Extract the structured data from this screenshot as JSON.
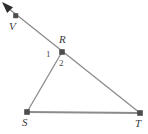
{
  "figure": {
    "type": "geometry-diagram",
    "background_color": "#ffffff",
    "line_color": "#8c8c8c",
    "marker_color": "#4d4d4d",
    "label_color": "#3a3a3a",
    "width": 148,
    "height": 134,
    "points": [
      {
        "id": "arrowtip",
        "label": "",
        "x": 2.5,
        "y": 2.5,
        "marker": false
      },
      {
        "id": "V",
        "label": "V",
        "x": 16,
        "y": 16,
        "marker": true
      },
      {
        "id": "R",
        "label": "R",
        "x": 62,
        "y": 52,
        "marker": true
      },
      {
        "id": "S",
        "label": "S",
        "x": 27,
        "y": 112,
        "marker": true
      },
      {
        "id": "T",
        "label": "T",
        "x": 140,
        "y": 113,
        "marker": true
      }
    ],
    "segments": [
      {
        "id": "ray-VR-T",
        "from": "arrowtip",
        "to": "T",
        "arrow_at_start": true
      },
      {
        "id": "seg-RS",
        "from": "R",
        "to": "S",
        "arrow_at_start": false
      },
      {
        "id": "seg-ST",
        "from": "S",
        "to": "T",
        "arrow_at_start": false
      }
    ],
    "angle_labels": [
      {
        "id": "angle-1",
        "label": "1",
        "x": 50,
        "y": 55
      },
      {
        "id": "angle-2",
        "label": "2",
        "x": 63,
        "y": 64
      }
    ]
  }
}
